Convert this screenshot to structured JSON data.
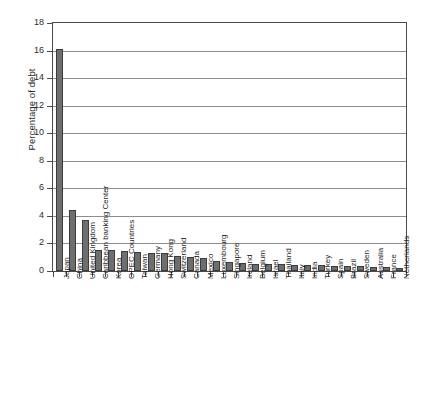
{
  "chart_data": {
    "type": "bar",
    "title": "",
    "xlabel": "",
    "ylabel": "Percentage of debt",
    "ylim": [
      0,
      18
    ],
    "ytick_values": [
      "0",
      "2",
      "4",
      "6",
      "8",
      "10",
      "12",
      "14",
      "16",
      "18"
    ],
    "grid": true,
    "legend": "none",
    "bar_color": "#6e6e6e",
    "bar_edge_color": "#3c3c3c",
    "axis_color": "#4a4a4a",
    "categories": [
      "Japan",
      "China",
      "United Kingdom",
      "Caribbean banking Center",
      "Korea",
      "OPEC Countries",
      "Taiwan",
      "Germany",
      "Hong Kong",
      "Switzerland",
      "Canada",
      "Mexico",
      "Luxembourg",
      "Singapore",
      "Ireland",
      "Belgium",
      "Israel",
      "Thailand",
      "Italy",
      "India",
      "Turkey",
      "Spain",
      "Brazil",
      "Sweden",
      "Australia",
      "France",
      "Netherlands"
    ],
    "values": [
      16.1,
      4.4,
      3.7,
      1.55,
      1.55,
      1.45,
      1.4,
      1.3,
      1.3,
      1.1,
      1.0,
      0.95,
      0.7,
      0.65,
      0.55,
      0.5,
      0.5,
      0.48,
      0.45,
      0.45,
      0.42,
      0.4,
      0.38,
      0.35,
      0.32,
      0.3,
      0.25
    ]
  }
}
